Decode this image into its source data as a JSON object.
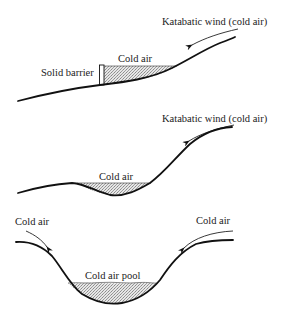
{
  "diagram": {
    "panels": [
      {
        "id": "barrier",
        "labels": {
          "wind": "Katabatic wind (cold air)",
          "cold_air": "Cold air",
          "barrier": "Solid barrier"
        }
      },
      {
        "id": "depression",
        "labels": {
          "wind": "Katabatic wind (cold air)",
          "cold_air": "Cold air"
        }
      },
      {
        "id": "valley",
        "labels": {
          "cold_air_left": "Cold air",
          "cold_air_right": "Cold air",
          "pool": "Cold air pool"
        }
      }
    ],
    "colors": {
      "line": "#111111",
      "fill": "#d8d8d8",
      "background": "#ffffff"
    }
  }
}
